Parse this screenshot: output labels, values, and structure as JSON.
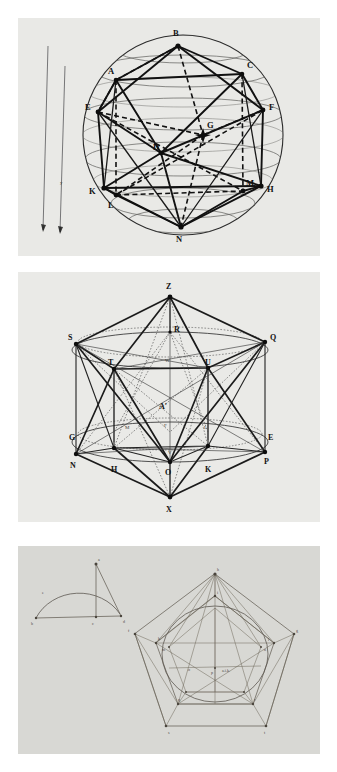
{
  "document": {
    "title": "Three geometric plate figures",
    "background_color": "#ffffff",
    "panel_count": 3
  },
  "figures": [
    {
      "id": "figure-1",
      "name": "icosahedron-inscribed-in-sphere",
      "caption": "",
      "background_color": "#e9e9e6",
      "labels": [
        "B",
        "A",
        "C",
        "E",
        "F",
        "G",
        "D",
        "K",
        "H",
        "L",
        "M",
        "N"
      ],
      "side_scale_labels": [
        "y",
        "x"
      ],
      "latitude_circles": 7,
      "vertex_labels": {
        "B": "B",
        "A": "A",
        "C": "C",
        "E": "E",
        "F": "F",
        "G": "G",
        "D": "D",
        "K": "K",
        "H": "H",
        "L": "L",
        "M": "M",
        "N": "N"
      }
    },
    {
      "id": "figure-2",
      "name": "icosahedron-antiprism-construction",
      "caption": "",
      "background_color": "#eaeae7",
      "labels": [
        "Z",
        "S",
        "Q",
        "R",
        "W",
        "T",
        "U",
        "A'",
        "F",
        "M",
        "L",
        "G",
        "E",
        "V",
        "N",
        "H",
        "O",
        "K",
        "P",
        "X"
      ],
      "apex_top": "Z",
      "apex_bottom": "X",
      "centre_label": "A'"
    },
    {
      "id": "figure-3",
      "name": "manuscript-pentagon-dodecahedron-sketch",
      "caption": "",
      "background_color": "#d8d8d4",
      "sub_figures": [
        "semicircle-construction",
        "pentagonal-projection"
      ],
      "annotation_text": "a.i.k.",
      "faint_labels": [
        "a",
        "b",
        "c",
        "d",
        "e",
        "f",
        "g",
        "h",
        "i",
        "k",
        "l",
        "m",
        "n",
        "o",
        "p",
        "q",
        "r",
        "s",
        "t"
      ]
    }
  ],
  "colors": {
    "paper_white": "#ffffff",
    "plate_grey": "#e9e9e6",
    "manuscript_grey": "#d8d8d4",
    "ink_black": "#111111",
    "ink_faint": "#5b564c"
  }
}
